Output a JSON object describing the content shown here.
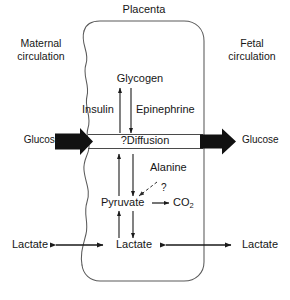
{
  "diagram": {
    "title": "Placenta",
    "type": "biochemical-pathway-diagram",
    "left_compartment": {
      "line1": "Maternal",
      "line2": "circulation",
      "full": "Maternal circulation"
    },
    "right_compartment": {
      "line1": "Fetal",
      "line2": "circulation",
      "full": "Fetal circulation"
    },
    "nodes": {
      "glycogen": "Glycogen",
      "insulin": "Insulin",
      "epinephrine": "Epinephrine",
      "diffusion": "?Diffusion",
      "alanine": "Alanine",
      "question": "?",
      "pyruvate": "Pyruvate",
      "co2": "CO",
      "co2_subscript": "2",
      "glucose_maternal": "Glucose",
      "glucose_fetal": "Glucose",
      "lactate_maternal": "Lactate",
      "lactate_placental": "Lactate",
      "lactate_fetal": "Lactate"
    },
    "colors": {
      "outline": "#4a4a4a",
      "arrow": "#1a1a1a",
      "thick_arrow": "#111111",
      "text": "#161616",
      "background": "#ffffff"
    }
  }
}
